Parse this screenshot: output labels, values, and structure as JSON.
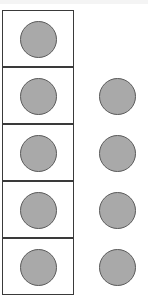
{
  "diagram": {
    "colors": {
      "background": "#ffffff",
      "box_border": "#3a3a3a",
      "counter_fill": "#a9a9a9",
      "counter_outline": "#5a5a5a"
    },
    "left_column": {
      "boxes": [
        {
          "row": 1,
          "has_counter": true
        },
        {
          "row": 2,
          "has_counter": true
        },
        {
          "row": 3,
          "has_counter": true
        },
        {
          "row": 4,
          "has_counter": true
        },
        {
          "row": 5,
          "has_counter": true
        }
      ]
    },
    "right_column": {
      "counters": [
        {
          "row": 2
        },
        {
          "row": 3
        },
        {
          "row": 4
        },
        {
          "row": 5
        }
      ]
    },
    "visible_counter_total": 9
  }
}
